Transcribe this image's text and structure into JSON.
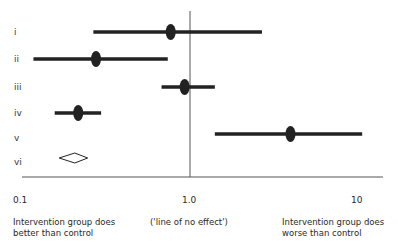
{
  "chart_data": {
    "type": "forest",
    "title": "",
    "x_scale": "log",
    "xlim": [
      0.1,
      10
    ],
    "x_ticks": [
      "0.1",
      "1.0",
      "10"
    ],
    "reference_line": {
      "value": 1.0,
      "label": "('line of no effect')"
    },
    "x_captions": {
      "left": "Intervention group does better than control",
      "center": "('line of no effect')",
      "right": "Intervention group does worse than control"
    },
    "grid": false,
    "legend": null,
    "rows": [
      {
        "label": "i",
        "point": 0.77,
        "ci_low": 0.27,
        "ci_high": 2.65,
        "marker": "filled-ellipse"
      },
      {
        "label": "ii",
        "point": 0.28,
        "ci_low": 0.12,
        "ci_high": 0.74,
        "marker": "filled-ellipse"
      },
      {
        "label": "iii",
        "point": 0.93,
        "ci_low": 0.68,
        "ci_high": 1.4,
        "marker": "filled-ellipse"
      },
      {
        "label": "iv",
        "point": 0.22,
        "ci_low": 0.16,
        "ci_high": 0.3,
        "marker": "filled-ellipse"
      },
      {
        "label": "v",
        "point": 3.9,
        "ci_low": 1.4,
        "ci_high": 10.3,
        "marker": "filled-ellipse"
      },
      {
        "label": "vi",
        "point": 0.21,
        "ci_low": 0.17,
        "ci_high": 0.25,
        "marker": "open-diamond"
      }
    ]
  },
  "rows": {
    "r0": "i",
    "r1": "ii",
    "r2": "iii",
    "r3": "iv",
    "r4": "v",
    "r5": "vi"
  },
  "axis": {
    "tick_0": "0.1",
    "tick_1": "1.0",
    "tick_2": "10"
  },
  "captions": {
    "left_line1": "Intervention group does",
    "left_line2": "better than control",
    "center": "('line of no effect')",
    "right_line1": "Intervention group does",
    "right_line2": "worse than control"
  },
  "colors": {
    "ink": "#222222",
    "axis": "#555555",
    "background": "#ffffff"
  }
}
